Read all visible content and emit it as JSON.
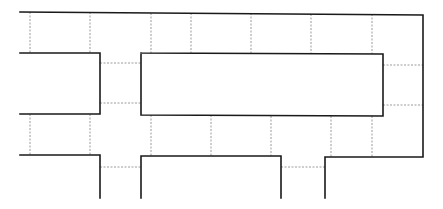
{
  "diagram": {
    "type": "floor-plan-grid",
    "width": 443,
    "height": 209,
    "colors": {
      "wall": "#1a1a1a",
      "divider": "#9a9a9a",
      "background": "#ffffff"
    },
    "walls": [
      {
        "id": "top-outer",
        "points": "20,12 423,15 423,157 325,157 325,198"
      },
      {
        "id": "left-upper-block",
        "points": "20,53 100,53 100,114 20,114"
      },
      {
        "id": "center-block",
        "points": "141,53 383,54 383,116 141,115 141,53"
      },
      {
        "id": "left-lower-block",
        "points": "20,155 100,155 100,198"
      },
      {
        "id": "center-lower-block",
        "points": "141,198 141,156 281,156 281,198"
      }
    ],
    "dividers": [
      {
        "x1": 30,
        "y1": 12,
        "x2": 30,
        "y2": 53
      },
      {
        "x1": 90,
        "y1": 12,
        "x2": 90,
        "y2": 53
      },
      {
        "x1": 151,
        "y1": 13,
        "x2": 151,
        "y2": 53
      },
      {
        "x1": 191,
        "y1": 13,
        "x2": 191,
        "y2": 53
      },
      {
        "x1": 251,
        "y1": 13,
        "x2": 251,
        "y2": 53
      },
      {
        "x1": 311,
        "y1": 14,
        "x2": 311,
        "y2": 54
      },
      {
        "x1": 372,
        "y1": 14,
        "x2": 372,
        "y2": 54
      },
      {
        "x1": 100,
        "y1": 63,
        "x2": 141,
        "y2": 63
      },
      {
        "x1": 100,
        "y1": 103,
        "x2": 141,
        "y2": 103
      },
      {
        "x1": 383,
        "y1": 65,
        "x2": 423,
        "y2": 65
      },
      {
        "x1": 383,
        "y1": 105,
        "x2": 423,
        "y2": 105
      },
      {
        "x1": 30,
        "y1": 114,
        "x2": 30,
        "y2": 155
      },
      {
        "x1": 90,
        "y1": 114,
        "x2": 90,
        "y2": 155
      },
      {
        "x1": 151,
        "y1": 115,
        "x2": 151,
        "y2": 156
      },
      {
        "x1": 211,
        "y1": 115,
        "x2": 211,
        "y2": 156
      },
      {
        "x1": 271,
        "y1": 116,
        "x2": 271,
        "y2": 156
      },
      {
        "x1": 331,
        "y1": 116,
        "x2": 331,
        "y2": 157
      },
      {
        "x1": 372,
        "y1": 116,
        "x2": 372,
        "y2": 157
      },
      {
        "x1": 100,
        "y1": 167,
        "x2": 141,
        "y2": 167
      },
      {
        "x1": 281,
        "y1": 167,
        "x2": 325,
        "y2": 167
      }
    ]
  }
}
